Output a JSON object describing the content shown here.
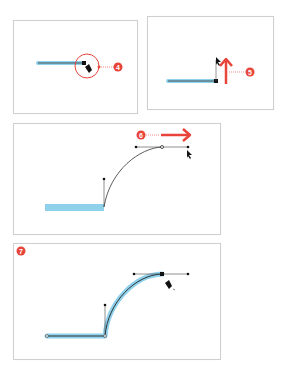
{
  "colors": {
    "accent_red": "#e8443a",
    "highlight_blue": "#8fd0ea",
    "path_black": "#222222",
    "panel_border": "#cfcfcf"
  },
  "steps": [
    {
      "number": "4",
      "description": "Pen tool cursor over end anchor point, circled"
    },
    {
      "number": "5",
      "description": "Drag upward to pull direction handle"
    },
    {
      "number": "6",
      "description": "Drag right to create curved segment"
    },
    {
      "number": "7",
      "description": "Completed path highlighted"
    }
  ]
}
